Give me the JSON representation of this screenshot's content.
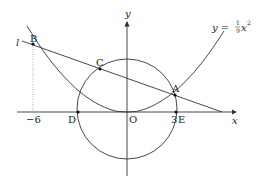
{
  "diagram": {
    "curve_label": "y = ",
    "curve_frac_num": "1",
    "curve_frac_den": "9",
    "curve_var": "x",
    "curve_exp": "2",
    "line_label": "l",
    "axis_x_label": "x",
    "axis_y_label": "y",
    "points": {
      "A": "A",
      "B": "B",
      "C": "C",
      "D": "D",
      "E": "E",
      "O": "O"
    },
    "ticks": {
      "neg6": "−6",
      "pos3": "3"
    }
  }
}
